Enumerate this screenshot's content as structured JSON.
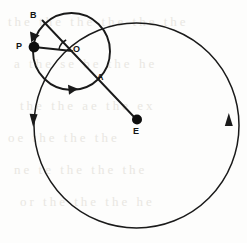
{
  "figure": {
    "type": "geometric-diagram",
    "width": 247,
    "height": 243,
    "stroke_color": "#1a1a1a",
    "background_color": "#fdfdfc",
    "points": [
      {
        "id": "P",
        "label": "P",
        "x": 34,
        "y": 47,
        "dot": true,
        "dot_radius": 5.2,
        "label_x": 16,
        "label_y": 43
      },
      {
        "id": "O",
        "label": "O",
        "x": 71.5,
        "y": 51.5,
        "dot": false,
        "label_x": 73,
        "label_y": 45
      },
      {
        "id": "B",
        "label": "B",
        "x": 44,
        "y": 22,
        "dot": false,
        "label_x": 30,
        "label_y": 12
      },
      {
        "id": "A",
        "label": "A",
        "x": 100,
        "y": 73,
        "dot": false,
        "label_x": 97,
        "label_y": 74
      },
      {
        "id": "E",
        "label": "E",
        "x": 137,
        "y": 120,
        "dot": true,
        "dot_radius": 5.0,
        "label_x": 133,
        "label_y": 127
      }
    ],
    "circles": [
      {
        "id": "epicycle",
        "name": "small-circle-epicycle",
        "cx": 71.5,
        "cy": 51.5,
        "r": 38.5,
        "stroke_width": 1.8
      },
      {
        "id": "deferent",
        "name": "large-circle-deferent",
        "cx": 136.5,
        "cy": 125.5,
        "r": 102.5,
        "stroke_width": 1.5
      }
    ],
    "lines": [
      {
        "id": "PO",
        "name": "line-P-to-O",
        "x1": 34,
        "y1": 47,
        "x2": 71.5,
        "y2": 51.5,
        "stroke_width": 1.8
      },
      {
        "id": "BE",
        "name": "line-B-through-O-to-E",
        "x1": 44,
        "y1": 22,
        "x2": 137,
        "y2": 120,
        "stroke_width": 1.8
      }
    ],
    "angle_arc": {
      "name": "angle-arc-at-O",
      "cx": 71.5,
      "cy": 51.5,
      "r": 13
    },
    "arrows": [
      {
        "id": "epicycle-top-arrow",
        "name": "direction-arrow-epicycle-top",
        "x": 34.5,
        "y": 33,
        "angle": 118
      },
      {
        "id": "epicycle-bottom-arrow",
        "name": "direction-arrow-epicycle-bottom",
        "x": 70,
        "y": 89.5,
        "angle": -8
      },
      {
        "id": "deferent-left-arrow",
        "name": "direction-arrow-deferent-left",
        "x": 33.5,
        "y": 120,
        "angle": 92
      },
      {
        "id": "deferent-right-arrow",
        "name": "direction-arrow-deferent-right",
        "x": 228.5,
        "y": 120,
        "angle": -88
      }
    ],
    "labels": {
      "P": "P",
      "O": "O",
      "B": "B",
      "A": "A",
      "E": "E"
    }
  },
  "background_text": {
    "note": "faint scanned page show-through text",
    "lines": [
      "the the the the the the",
      "a the se be the he",
      "the the ae the ex",
      "oe the the the",
      "ne te the the the",
      "or the the the he"
    ]
  }
}
